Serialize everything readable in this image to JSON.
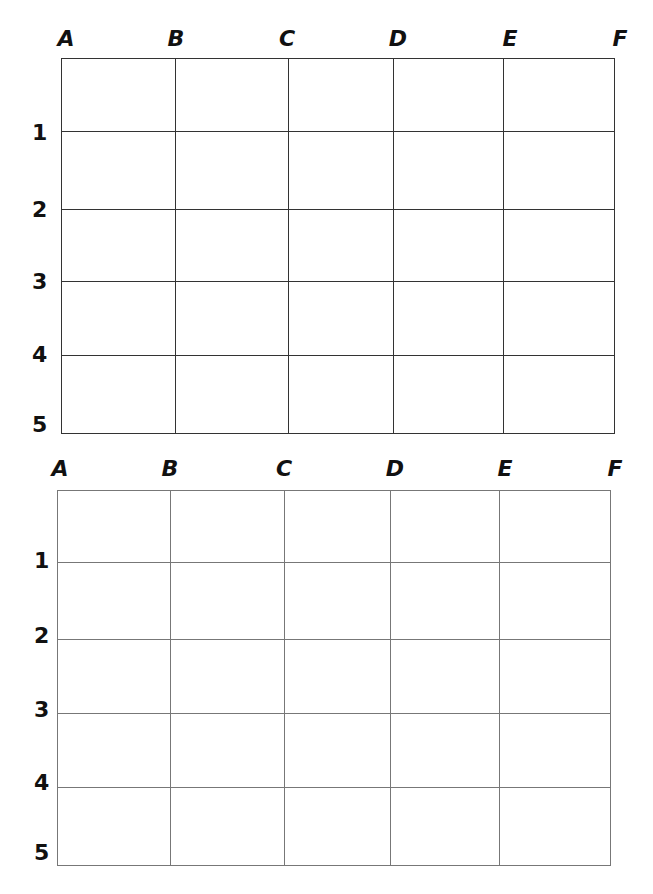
{
  "worksheet": {
    "grids": [
      {
        "columns": [
          "A",
          "B",
          "C",
          "D",
          "E",
          "F"
        ],
        "rows": [
          "1",
          "2",
          "3",
          "4",
          "5"
        ]
      },
      {
        "columns": [
          "A",
          "B",
          "C",
          "D",
          "E",
          "F"
        ],
        "rows": [
          "1",
          "2",
          "3",
          "4",
          "5"
        ]
      }
    ]
  }
}
